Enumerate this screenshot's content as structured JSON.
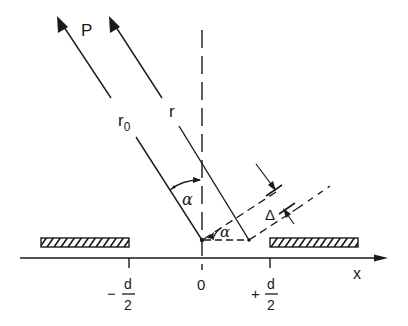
{
  "diagram": {
    "labels": {
      "beam": "P",
      "r0": "r",
      "r0_sub": "0",
      "r": "r",
      "alpha_top": "α",
      "alpha_bottom": "α",
      "delta": "Δ",
      "x_axis": "x",
      "origin": "0",
      "tick_left_sign": "−",
      "tick_left_num": "d",
      "tick_left_den": "2",
      "tick_right_sign": "+",
      "tick_right_num": "d",
      "tick_right_den": "2"
    },
    "colors": {
      "line": "#1a1a1a",
      "background": "#ffffff"
    }
  }
}
